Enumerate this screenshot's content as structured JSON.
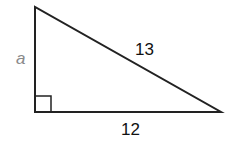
{
  "diagram": {
    "type": "right-triangle",
    "vertices": {
      "top": [
        35,
        7
      ],
      "right_angle": [
        35,
        112
      ],
      "right": [
        221,
        112
      ]
    },
    "right_angle_marker": {
      "x": 35,
      "y": 96,
      "size": 16
    },
    "sides": {
      "vertical_leg": {
        "label": "a",
        "color": "#8a8a8a"
      },
      "hypotenuse": {
        "label": "13",
        "color": "#111111"
      },
      "horizontal_leg": {
        "label": "12",
        "color": "#111111"
      }
    },
    "stroke_color": "#222222",
    "stroke_width": 2
  }
}
